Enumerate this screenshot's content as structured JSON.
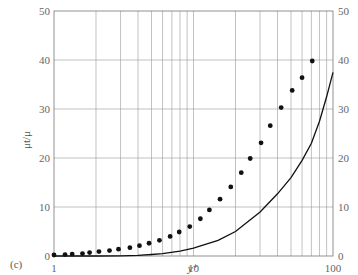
{
  "panel_label": "(c)",
  "chart_data": {
    "type": "scatter+line",
    "title": "",
    "xlabel": "y⁺",
    "ylabel": "μt/μ",
    "xscale": "log",
    "xlim": [
      1,
      100
    ],
    "ylim": [
      0,
      50
    ],
    "x_ticks": [
      "1",
      "10",
      "100"
    ],
    "y_ticks": [
      "0",
      "10",
      "20",
      "30",
      "40",
      "50"
    ],
    "grid": true,
    "legend": null,
    "series": [
      {
        "name": "points",
        "style": "dots",
        "x": [
          1.0,
          1.2,
          1.35,
          1.6,
          1.8,
          2.1,
          2.5,
          2.9,
          3.5,
          4.1,
          4.8,
          5.7,
          6.8,
          7.9,
          9.4,
          11.2,
          13.0,
          15.5,
          18.5,
          22.0,
          25.5,
          30.5,
          35.5,
          42.5,
          51,
          60,
          71
        ],
        "y": [
          0.2,
          0.3,
          0.4,
          0.5,
          0.7,
          0.9,
          1.1,
          1.4,
          1.7,
          2.1,
          2.6,
          3.2,
          4.0,
          4.9,
          6.0,
          7.6,
          9.4,
          11.6,
          14.1,
          17.0,
          19.9,
          23.1,
          26.6,
          30.3,
          33.8,
          36.4,
          39.8
        ]
      },
      {
        "name": "curve",
        "style": "solid-line",
        "x": [
          1,
          2,
          3,
          4,
          5,
          6,
          8,
          10,
          15,
          20,
          30,
          40,
          50,
          60,
          70,
          80,
          90,
          100
        ],
        "y": [
          0,
          0,
          0.05,
          0.15,
          0.3,
          0.5,
          1.0,
          1.6,
          3.2,
          5.0,
          9.0,
          12.7,
          16.0,
          19.5,
          23.0,
          27.5,
          32.5,
          37.5
        ]
      }
    ]
  }
}
